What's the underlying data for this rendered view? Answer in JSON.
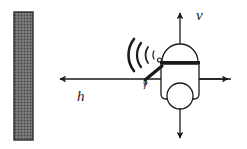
{
  "figure": {
    "kind": "robot-sonar-wall-diagram",
    "caption": "",
    "background_color": "#ffffff",
    "stroke_color": "#1a1a1a",
    "wall_fill_color": "#6b6b6b",
    "wall_border_color": "#2b2b2b"
  },
  "labels": {
    "vertical_axis": "v",
    "horizontal_axis": "h",
    "angle": "γ"
  },
  "elements": {
    "wall_name": "wall",
    "robot_name": "mobile-robot",
    "sonar_name": "sonar-waves",
    "sensor_arm_name": "sensor-arm",
    "wheel_name": "robot-wheel",
    "dome_name": "robot-dome-head",
    "body_name": "robot-body"
  },
  "axes": {
    "horizontal": {
      "x_start": 231,
      "x_end": 57,
      "y": 79,
      "arrow_left": true,
      "arrow_right": true
    },
    "vertical": {
      "x": 180,
      "y_top": 10,
      "y_bottom": 141,
      "arrow_up": true,
      "arrow_down": true
    }
  }
}
